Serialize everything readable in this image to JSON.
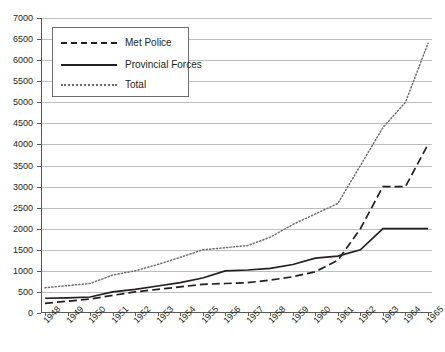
{
  "chart_data": {
    "type": "line",
    "title": "",
    "xlabel": "",
    "ylabel": "",
    "ylim": [
      0,
      7000
    ],
    "ytick_step": 500,
    "grid": true,
    "legend_position": "top-left",
    "categories": [
      "1948",
      "1949",
      "1950",
      "1951",
      "1952",
      "1953",
      "1954",
      "1955",
      "1956",
      "1957",
      "1958",
      "1959",
      "1960",
      "1961",
      "1962",
      "1963",
      "1964",
      "1965"
    ],
    "yticks": [
      "0",
      "500",
      "1000",
      "1500",
      "2000",
      "2500",
      "3000",
      "3500",
      "4000",
      "4500",
      "5000",
      "5500",
      "6000",
      "6500",
      "7000"
    ],
    "series": [
      {
        "name": "Met Police",
        "style": "dashed",
        "color": "#231f20",
        "values": [
          230,
          280,
          330,
          420,
          500,
          560,
          620,
          680,
          700,
          720,
          780,
          860,
          980,
          1250,
          2000,
          3000,
          3000,
          4000
        ]
      },
      {
        "name": "Provincial Forces",
        "style": "solid",
        "color": "#231f20",
        "values": [
          350,
          360,
          380,
          500,
          560,
          640,
          720,
          830,
          1000,
          1020,
          1060,
          1150,
          1300,
          1350,
          1500,
          2000,
          2000,
          2000
        ]
      },
      {
        "name": "Total",
        "style": "dotted",
        "color": "#6d6e71",
        "values": [
          600,
          650,
          700,
          900,
          1000,
          1150,
          1320,
          1500,
          1550,
          1600,
          1800,
          2100,
          2350,
          2600,
          3500,
          4400,
          5000,
          6400
        ]
      }
    ]
  },
  "legend": {
    "items": [
      {
        "label": "Met Police"
      },
      {
        "label": "Provincial Forces"
      },
      {
        "label": "Total"
      }
    ]
  }
}
